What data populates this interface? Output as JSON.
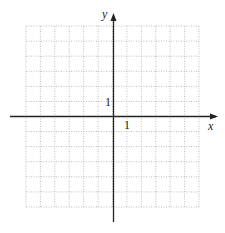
{
  "graph": {
    "x_axis_label": "x",
    "y_axis_label": "y",
    "x_tick_label": "1",
    "y_tick_label": "1",
    "grid": {
      "columns": 12,
      "rows": 12,
      "left": 26,
      "top": 26,
      "right": 199,
      "bottom": 207,
      "line_color": "#c8c8c8"
    },
    "axis_color": "#222222"
  }
}
